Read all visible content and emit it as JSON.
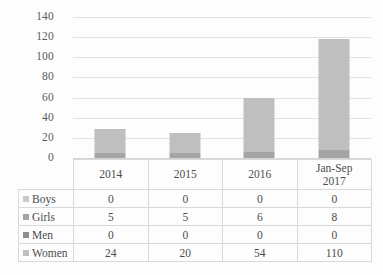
{
  "chart_data": {
    "type": "bar",
    "subtype": "stacked-column",
    "title": "",
    "xlabel": "",
    "ylabel": "",
    "ylim": [
      0,
      140
    ],
    "ytick_interval": 20,
    "yticks": [
      140,
      120,
      100,
      80,
      60,
      40,
      20,
      0
    ],
    "ytick_labels": [
      "140",
      "120",
      "100",
      "80",
      "60",
      "40",
      "20",
      "0"
    ],
    "grid": true,
    "legend_position": "data-table-row-labels",
    "categories": [
      "2014",
      "2015",
      "2016",
      "Jan-Sep 2017"
    ],
    "category_lines": [
      [
        "2014"
      ],
      [
        "2015"
      ],
      [
        "2016"
      ],
      [
        "Jan-Sep",
        "2017"
      ]
    ],
    "series": [
      {
        "name": "Boys",
        "values": [
          0,
          0,
          0,
          0
        ],
        "color": "#c9c9c9",
        "swatch_class": "sw-boys",
        "seg_class": "seg-boys"
      },
      {
        "name": "Girls",
        "values": [
          5,
          5,
          6,
          8
        ],
        "color": "#a5a5a5",
        "swatch_class": "sw-girls",
        "seg_class": "seg-girls"
      },
      {
        "name": "Men",
        "values": [
          0,
          0,
          0,
          0
        ],
        "color": "#8e8e8e",
        "swatch_class": "sw-men",
        "seg_class": "seg-men"
      },
      {
        "name": "Women",
        "values": [
          24,
          20,
          54,
          110
        ],
        "color": "#bfbfbf",
        "swatch_class": "sw-women",
        "seg_class": "seg-women"
      }
    ],
    "stack_totals": [
      29,
      25,
      60,
      118
    ],
    "data_table_headers": [
      "",
      "2014",
      "2015",
      "2016",
      "Jan-Sep 2017"
    ],
    "data_table_rows": [
      {
        "label": "Boys",
        "cells": [
          "0",
          "0",
          "0",
          "0"
        ]
      },
      {
        "label": "Girls",
        "cells": [
          "5",
          "5",
          "6",
          "8"
        ]
      },
      {
        "label": "Men",
        "cells": [
          "0",
          "0",
          "0",
          "0"
        ]
      },
      {
        "label": "Women",
        "cells": [
          "24",
          "20",
          "54",
          "110"
        ]
      }
    ]
  }
}
